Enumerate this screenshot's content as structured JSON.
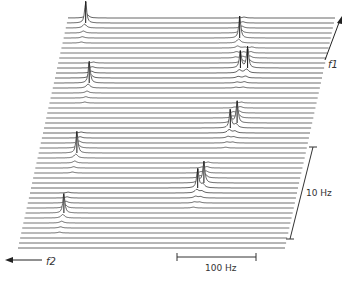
{
  "chart_data": {
    "type": "waterfall",
    "title": "",
    "x_axis": {
      "label": "f2",
      "direction": "left",
      "scale_bar_label": "100 Hz",
      "scale_bar_hz": 100
    },
    "y_axis": {
      "label": "f1",
      "direction": "up",
      "scale_bar_label": "10 Hz",
      "scale_bar_hz": 10
    },
    "n_traces": 47,
    "x_range_hz": [
      0,
      370
    ],
    "peaks": [
      {
        "name": "peak-a",
        "trace": 1,
        "x_hz": 26,
        "height": 1.0
      },
      {
        "name": "peak-b",
        "trace": 13,
        "x_hz": 49,
        "height": 1.0
      },
      {
        "name": "peak-c",
        "trace": 27,
        "x_hz": 53,
        "height": 1.0
      },
      {
        "name": "peak-d",
        "trace": 39,
        "x_hz": 53,
        "height": 0.9
      },
      {
        "name": "peak-e",
        "trace": 4,
        "x_hz": 244,
        "height": 1.0
      },
      {
        "name": "peak-f",
        "trace": 10,
        "x_hz": 264,
        "height": 1.0
      },
      {
        "name": "peak-g",
        "trace": 10,
        "x_hz": 254,
        "height": 0.8
      },
      {
        "name": "peak-h",
        "trace": 21,
        "x_hz": 266,
        "height": 1.0
      },
      {
        "name": "peak-i",
        "trace": 22,
        "x_hz": 258,
        "height": 0.85
      },
      {
        "name": "peak-j",
        "trace": 33,
        "x_hz": 238,
        "height": 1.0
      },
      {
        "name": "peak-k",
        "trace": 34,
        "x_hz": 231,
        "height": 0.9
      }
    ]
  }
}
